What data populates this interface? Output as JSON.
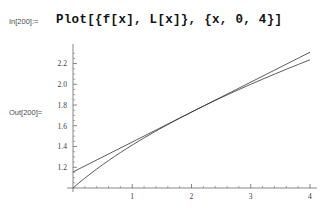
{
  "notebook": {
    "input_label": "In[200]:=",
    "input_code": "Plot[{f[x], L[x]}, {x, 0, 4}]",
    "output_label": "Out[200]="
  },
  "chart_data": {
    "type": "line",
    "title": "",
    "xlabel": "",
    "ylabel": "",
    "xlim": [
      0,
      4
    ],
    "ylim": [
      1.0,
      2.35
    ],
    "grid": false,
    "legend": "none",
    "x_ticks": [
      1,
      2,
      3,
      4
    ],
    "x_tick_labels": [
      "1",
      "2",
      "3",
      "4"
    ],
    "y_ticks": [
      1.2,
      1.4,
      1.6,
      1.8,
      2.0,
      2.2
    ],
    "y_tick_labels": [
      "1.2",
      "1.4",
      "1.6",
      "1.8",
      "2.0",
      "2.2"
    ],
    "x_minor_ticks": [
      0.2,
      0.4,
      0.6,
      0.8,
      1.2,
      1.4,
      1.6,
      1.8,
      2.2,
      2.4,
      2.6,
      2.8,
      3.2,
      3.4,
      3.6,
      3.8
    ],
    "y_minor_ticks": [
      1.05,
      1.1,
      1.15,
      1.25,
      1.3,
      1.35,
      1.45,
      1.5,
      1.55,
      1.65,
      1.7,
      1.75,
      1.85,
      1.9,
      1.95,
      2.05,
      2.1,
      2.15,
      2.25,
      2.3
    ],
    "series": [
      {
        "name": "f[x]",
        "color": "#333333",
        "x": [
          0,
          0.1,
          0.2,
          0.3,
          0.4,
          0.5,
          0.6,
          0.7,
          0.8,
          0.9,
          1.0,
          1.2,
          1.4,
          1.6,
          1.8,
          2.0,
          2.2,
          2.4,
          2.6,
          2.8,
          3.0,
          3.2,
          3.4,
          3.6,
          3.8,
          4.0
        ],
        "values": [
          1.0,
          1.0488,
          1.0954,
          1.1402,
          1.1832,
          1.2247,
          1.2649,
          1.3038,
          1.3416,
          1.3784,
          1.4142,
          1.4832,
          1.5492,
          1.6125,
          1.6733,
          1.7321,
          1.7889,
          1.8439,
          1.8974,
          1.9494,
          2.0,
          2.0494,
          2.0976,
          2.1448,
          2.1909,
          2.2361
        ]
      },
      {
        "name": "L[x]",
        "color": "#333333",
        "x": [
          0,
          4
        ],
        "values": [
          1.1547,
          2.3094
        ]
      }
    ],
    "annotations": [
      {
        "text": "tangent point",
        "x": 2,
        "y": 1.7321
      }
    ]
  }
}
